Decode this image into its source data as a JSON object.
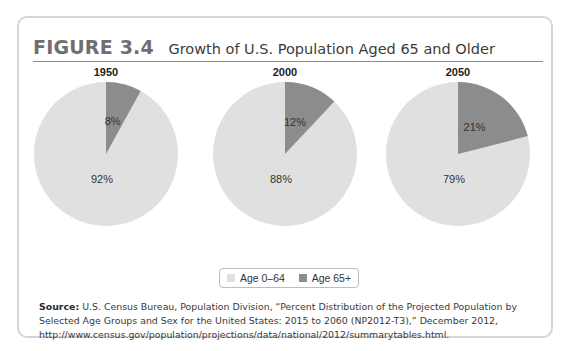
{
  "figure": {
    "label": "FIGURE 3.4",
    "title": "Growth of U.S. Population Aged 65 and Older"
  },
  "colors": {
    "age_0_64": "#e0e0e0",
    "age_65_plus": "#8c8c8c",
    "card_border": "#d6d6d6",
    "rule": "#8a8a8a"
  },
  "legend": {
    "items": [
      {
        "label": "Age 0–64",
        "color": "#e0e0e0"
      },
      {
        "label": "Age 65+",
        "color": "#8c8c8c"
      }
    ]
  },
  "pies": [
    {
      "year": "1950",
      "age_65_plus_label": "8%",
      "age_0_64_label": "92%"
    },
    {
      "year": "2000",
      "age_65_plus_label": "12%",
      "age_0_64_label": "88%"
    },
    {
      "year": "2050",
      "age_65_plus_label": "21%",
      "age_0_64_label": "79%"
    }
  ],
  "source": {
    "label": "Source:",
    "text": "U.S. Census Bureau, Population Division, “Percent Distribution of the Projected Population by Selected Age Groups and Sex for the United States: 2015 to 2060 (NP2012-T3),” December 2012, http://www.census.gov/population/projections/data/national/2012/summarytables.html."
  },
  "chart_data": [
    {
      "type": "pie",
      "title": "1950",
      "categories": [
        "Age 0–64",
        "Age 65+"
      ],
      "values": [
        92,
        8
      ],
      "unit": "%"
    },
    {
      "type": "pie",
      "title": "2000",
      "categories": [
        "Age 0–64",
        "Age 65+"
      ],
      "values": [
        88,
        12
      ],
      "unit": "%"
    },
    {
      "type": "pie",
      "title": "2050",
      "categories": [
        "Age 0–64",
        "Age 65+"
      ],
      "values": [
        79,
        21
      ],
      "unit": "%"
    }
  ]
}
